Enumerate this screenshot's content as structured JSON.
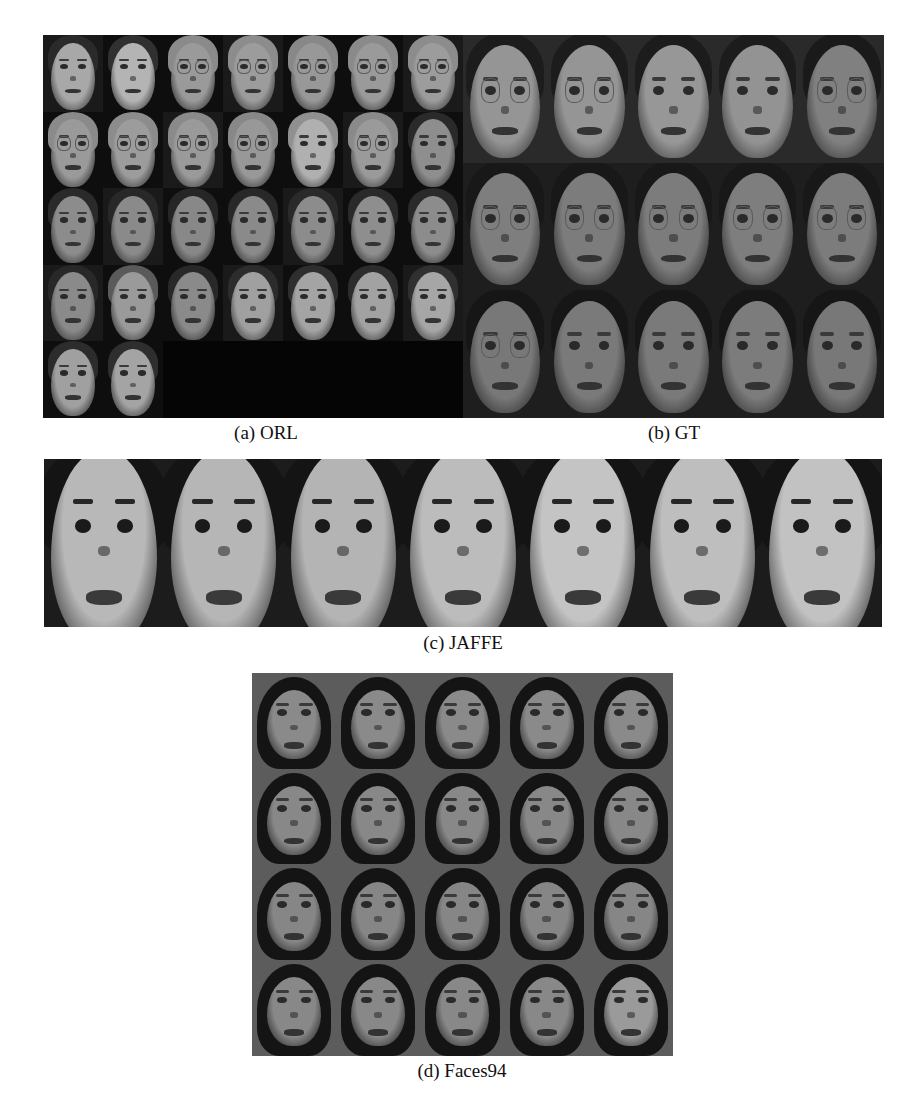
{
  "figure": {
    "panels": [
      {
        "id": "orl",
        "caption": "(a) ORL",
        "rows": 5,
        "cols": 7,
        "background": "#060606",
        "tiles": [
          {
            "face": "#a8a8a8",
            "hair": "#2a2a2a",
            "glasses": false
          },
          {
            "face": "#b4b4b4",
            "hair": "#303030",
            "glasses": false
          },
          {
            "face": "#9a9a9a",
            "hair": "#8a8a8a",
            "glasses": true
          },
          {
            "face": "#9c9c9c",
            "hair": "#8c8c8c",
            "glasses": true
          },
          {
            "face": "#989898",
            "hair": "#888888",
            "glasses": true
          },
          {
            "face": "#9a9a9a",
            "hair": "#8a8a8a",
            "glasses": true
          },
          {
            "face": "#9c9c9c",
            "hair": "#8c8c8c",
            "glasses": true
          },
          {
            "face": "#9a9a9a",
            "hair": "#8a8a8a",
            "glasses": true
          },
          {
            "face": "#9c9c9c",
            "hair": "#8c8c8c",
            "glasses": true
          },
          {
            "face": "#9a9a9a",
            "hair": "#8a8a8a",
            "glasses": true
          },
          {
            "face": "#989898",
            "hair": "#888888",
            "glasses": true
          },
          {
            "face": "#b0b0b0",
            "hair": "#909090",
            "glasses": false
          },
          {
            "face": "#9a9a9a",
            "hair": "#8a8a8a",
            "glasses": true
          },
          {
            "face": "#8e8e8e",
            "hair": "#2a2a2a",
            "glasses": false
          },
          {
            "face": "#8c8c8c",
            "hair": "#2a2a2a",
            "glasses": false
          },
          {
            "face": "#8a8a8a",
            "hair": "#282828",
            "glasses": false
          },
          {
            "face": "#888888",
            "hair": "#262626",
            "glasses": false
          },
          {
            "face": "#8a8a8a",
            "hair": "#282828",
            "glasses": false
          },
          {
            "face": "#8c8c8c",
            "hair": "#2a2a2a",
            "glasses": false
          },
          {
            "face": "#8e8e8e",
            "hair": "#2a2a2a",
            "glasses": false
          },
          {
            "face": "#8c8c8c",
            "hair": "#2a2a2a",
            "glasses": false
          },
          {
            "face": "#8a8a8a",
            "hair": "#282828",
            "glasses": false
          },
          {
            "face": "#9a9a9a",
            "hair": "#5a5a5a",
            "glasses": false
          },
          {
            "face": "#8a8a8a",
            "hair": "#282828",
            "glasses": false
          },
          {
            "face": "#a0a0a0",
            "hair": "#2c2c2c",
            "glasses": false
          },
          {
            "face": "#a4a4a4",
            "hair": "#2e2e2e",
            "glasses": false
          },
          {
            "face": "#a2a2a2",
            "hair": "#2c2c2c",
            "glasses": false
          },
          {
            "face": "#a6a6a6",
            "hair": "#303030",
            "glasses": false
          },
          {
            "face": "#a0a0a0",
            "hair": "#2c2c2c",
            "glasses": false
          },
          {
            "face": "#a4a4a4",
            "hair": "#2e2e2e",
            "glasses": false
          },
          null,
          null,
          null,
          null,
          null
        ]
      },
      {
        "id": "gt",
        "caption": "(b) GT",
        "rows": 3,
        "cols": 5,
        "background": "#121212",
        "tiles": [
          {
            "face": "#959595",
            "hair": "#1c1c1c",
            "glasses": true
          },
          {
            "face": "#959595",
            "hair": "#1c1c1c",
            "glasses": true
          },
          {
            "face": "#979797",
            "hair": "#1c1c1c",
            "glasses": false
          },
          {
            "face": "#939393",
            "hair": "#1c1c1c",
            "glasses": false
          },
          {
            "face": "#808080",
            "hair": "#1a1a1a",
            "glasses": true
          },
          {
            "face": "#7e7e7e",
            "hair": "#181818",
            "glasses": true
          },
          {
            "face": "#7c7c7c",
            "hair": "#181818",
            "glasses": true
          },
          {
            "face": "#7c7c7c",
            "hair": "#181818",
            "glasses": true
          },
          {
            "face": "#7e7e7e",
            "hair": "#181818",
            "glasses": true
          },
          {
            "face": "#7c7c7c",
            "hair": "#181818",
            "glasses": true
          },
          {
            "face": "#787878",
            "hair": "#161616",
            "glasses": true
          },
          {
            "face": "#7a7a7a",
            "hair": "#161616",
            "glasses": false
          },
          {
            "face": "#7a7a7a",
            "hair": "#161616",
            "glasses": false
          },
          {
            "face": "#7c7c7c",
            "hair": "#161616",
            "glasses": false
          },
          {
            "face": "#787878",
            "hair": "#161616",
            "glasses": false
          }
        ]
      },
      {
        "id": "jaffe",
        "caption": "(c) JAFFE",
        "rows": 1,
        "cols": 7,
        "background": "#1a1a1a",
        "expressions": [
          "disgust",
          "sadness",
          "fear",
          "happiness",
          "neutral",
          "sadness",
          "surprise"
        ],
        "tiles": [
          {
            "face": "#b8b8b8",
            "hair": "#141414",
            "glasses": false
          },
          {
            "face": "#b6b6b6",
            "hair": "#141414",
            "glasses": false
          },
          {
            "face": "#b4b4b4",
            "hair": "#141414",
            "glasses": false
          },
          {
            "face": "#bcbcbc",
            "hair": "#141414",
            "glasses": false
          },
          {
            "face": "#c4c4c4",
            "hair": "#141414",
            "glasses": false
          },
          {
            "face": "#bebebe",
            "hair": "#141414",
            "glasses": false
          },
          {
            "face": "#c2c2c2",
            "hair": "#141414",
            "glasses": false
          }
        ]
      },
      {
        "id": "faces94",
        "caption": "(d) Faces94",
        "rows": 4,
        "cols": 5,
        "background": "#5e5e5e",
        "tiles": [
          {
            "face": "#8a8a8a",
            "hair": "#141414",
            "glasses": false
          },
          {
            "face": "#8a8a8a",
            "hair": "#141414",
            "glasses": false
          },
          {
            "face": "#8a8a8a",
            "hair": "#141414",
            "glasses": false
          },
          {
            "face": "#8a8a8a",
            "hair": "#141414",
            "glasses": false
          },
          {
            "face": "#8a8a8a",
            "hair": "#141414",
            "glasses": false
          },
          {
            "face": "#888888",
            "hair": "#141414",
            "glasses": false
          },
          {
            "face": "#888888",
            "hair": "#141414",
            "glasses": false
          },
          {
            "face": "#888888",
            "hair": "#141414",
            "glasses": false
          },
          {
            "face": "#888888",
            "hair": "#141414",
            "glasses": false
          },
          {
            "face": "#888888",
            "hair": "#141414",
            "glasses": false
          },
          {
            "face": "#868686",
            "hair": "#141414",
            "glasses": false
          },
          {
            "face": "#868686",
            "hair": "#141414",
            "glasses": false
          },
          {
            "face": "#868686",
            "hair": "#141414",
            "glasses": false
          },
          {
            "face": "#868686",
            "hair": "#141414",
            "glasses": false
          },
          {
            "face": "#868686",
            "hair": "#141414",
            "glasses": false
          },
          {
            "face": "#888888",
            "hair": "#141414",
            "glasses": false
          },
          {
            "face": "#888888",
            "hair": "#141414",
            "glasses": false
          },
          {
            "face": "#888888",
            "hair": "#141414",
            "glasses": false
          },
          {
            "face": "#888888",
            "hair": "#141414",
            "glasses": false
          },
          {
            "face": "#9a9a9a",
            "hair": "#141414",
            "glasses": false
          }
        ]
      }
    ]
  }
}
